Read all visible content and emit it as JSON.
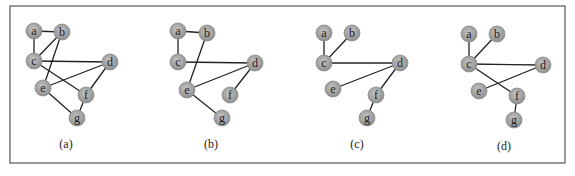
{
  "figure": {
    "frame": {
      "x": 10,
      "y": 6,
      "width": 555,
      "height": 157
    },
    "node_radius": 8,
    "colors": {
      "node_light": "#c4c4c4",
      "node_dark": "#8e8e8e",
      "edge": "#222222",
      "frame": "#555555"
    }
  },
  "graphs": [
    {
      "caption": "(a)",
      "caption_pos": [
        66,
        144
      ],
      "nodes": {
        "a": [
          34,
          31
        ],
        "b": [
          62,
          32
        ],
        "c": [
          34,
          61
        ],
        "d": [
          110,
          62
        ],
        "e": [
          43,
          88
        ],
        "f": [
          86,
          95
        ],
        "g": [
          77,
          118
        ]
      },
      "edges": [
        [
          "a",
          "b"
        ],
        [
          "a",
          "c"
        ],
        [
          "b",
          "c"
        ],
        [
          "b",
          "e"
        ],
        [
          "c",
          "d"
        ],
        [
          "c",
          "f"
        ],
        [
          "e",
          "d"
        ],
        [
          "d",
          "f"
        ],
        [
          "e",
          "g"
        ],
        [
          "f",
          "g"
        ]
      ]
    },
    {
      "caption": "(b)",
      "caption_pos": [
        211,
        144
      ],
      "nodes": {
        "a": [
          178,
          31
        ],
        "b": [
          207,
          33
        ],
        "c": [
          178,
          62
        ],
        "d": [
          255,
          63
        ],
        "e": [
          187,
          90
        ],
        "f": [
          230,
          95
        ],
        "g": [
          222,
          118
        ]
      },
      "edges": [
        [
          "a",
          "b"
        ],
        [
          "a",
          "c"
        ],
        [
          "b",
          "e"
        ],
        [
          "c",
          "d"
        ],
        [
          "e",
          "d"
        ],
        [
          "d",
          "f"
        ],
        [
          "e",
          "g"
        ]
      ]
    },
    {
      "caption": "(c)",
      "caption_pos": [
        357,
        144
      ],
      "nodes": {
        "a": [
          324,
          33
        ],
        "b": [
          352,
          33
        ],
        "c": [
          324,
          63
        ],
        "d": [
          400,
          63
        ],
        "e": [
          333,
          89
        ],
        "f": [
          376,
          95
        ],
        "g": [
          367,
          118
        ]
      },
      "edges": [
        [
          "a",
          "c"
        ],
        [
          "b",
          "c"
        ],
        [
          "c",
          "d"
        ],
        [
          "e",
          "d"
        ],
        [
          "d",
          "f"
        ],
        [
          "f",
          "g"
        ]
      ]
    },
    {
      "caption": "(d)",
      "caption_pos": [
        504,
        146
      ],
      "nodes": {
        "a": [
          469,
          34
        ],
        "b": [
          497,
          34
        ],
        "c": [
          469,
          64
        ],
        "d": [
          543,
          65
        ],
        "e": [
          479,
          91
        ],
        "f": [
          517,
          96
        ],
        "g": [
          514,
          120
        ]
      },
      "edges": [
        [
          "a",
          "c"
        ],
        [
          "b",
          "c"
        ],
        [
          "c",
          "d"
        ],
        [
          "e",
          "d"
        ],
        [
          "c",
          "f"
        ],
        [
          "f",
          "g"
        ]
      ]
    }
  ]
}
